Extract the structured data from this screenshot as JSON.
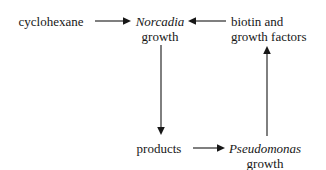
{
  "diagram": {
    "background_color": "#ffffff",
    "ink_color": "#171717",
    "nodes": [
      {
        "id": "cyclohexane",
        "lines": [
          "cyclohexane"
        ],
        "styles": [
          "plain"
        ],
        "align": "center",
        "x": 51,
        "y": 14
      },
      {
        "id": "norcadia-growth",
        "lines": [
          "Norcadia",
          "growth"
        ],
        "styles": [
          "sci",
          "plain"
        ],
        "align": "center",
        "x": 160,
        "y": 14
      },
      {
        "id": "biotin-growth-factors",
        "lines": [
          "biotin and",
          "growth factors"
        ],
        "styles": [
          "plain",
          "plain"
        ],
        "align": "left",
        "x": 231,
        "y": 14
      },
      {
        "id": "products",
        "lines": [
          "products"
        ],
        "styles": [
          "plain"
        ],
        "align": "center",
        "x": 159,
        "y": 141
      },
      {
        "id": "pseudomonas-growth",
        "lines": [
          "Pseudomonas",
          "growth"
        ],
        "styles": [
          "sci",
          "plain"
        ],
        "align": "center",
        "x": 265,
        "y": 141
      }
    ],
    "arrows": [
      {
        "id": "cyclohexane-to-norcadia",
        "label": "cyclohexane to Norcadia growth",
        "direction": "right",
        "x1": 95,
        "y1": 21,
        "x2": 128,
        "y2": 21
      },
      {
        "id": "biotin-to-norcadia",
        "label": "biotin and growth factors to Norcadia growth",
        "direction": "left",
        "x1": 226,
        "y1": 21,
        "x2": 191,
        "y2": 21
      },
      {
        "id": "norcadia-to-products",
        "label": "Norcadia growth to products",
        "direction": "down",
        "x1": 161,
        "y1": 45,
        "x2": 161,
        "y2": 133
      },
      {
        "id": "products-to-pseudomonas",
        "label": "products to Pseudomonas growth",
        "direction": "right",
        "x1": 193,
        "y1": 148,
        "x2": 222,
        "y2": 148
      },
      {
        "id": "pseudomonas-to-biotin",
        "label": "Pseudomonas growth to biotin and growth factors",
        "direction": "up",
        "x1": 267,
        "y1": 136,
        "x2": 267,
        "y2": 48
      }
    ]
  }
}
